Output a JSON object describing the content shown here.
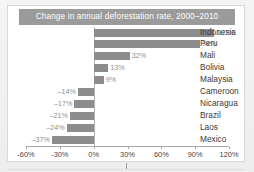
{
  "chart_data": {
    "type": "bar",
    "orientation": "horizontal",
    "title": "Change in annual deforestation rate, 2000–2010",
    "xlabel": "",
    "ylabel": "",
    "xlim": [
      -60,
      120
    ],
    "grid": false,
    "legend": null,
    "bar_color": "#8c8c8c",
    "title_background": "#9b9b9b",
    "title_color": "#ffffff",
    "categories": [
      "Indonesia",
      "Peru",
      "Mali",
      "Bolivia",
      "Malaysia",
      "Cameroon",
      "Nicaragua",
      "Brazil",
      "Laos",
      "Mexico"
    ],
    "values": [
      107,
      94,
      32,
      13,
      9,
      -14,
      -17,
      -21,
      -24,
      -37
    ],
    "data_labels": [
      "107%",
      "94%",
      "32%",
      "13%",
      "9%",
      "–14%",
      "–17%",
      "–21%",
      "–24%",
      "–37%"
    ],
    "xticks": [
      -60,
      -30,
      0,
      30,
      60,
      90,
      120
    ],
    "xtick_labels": [
      "-60%",
      "-30%",
      "0%",
      "30%",
      "60%",
      "90%",
      "120%"
    ]
  }
}
